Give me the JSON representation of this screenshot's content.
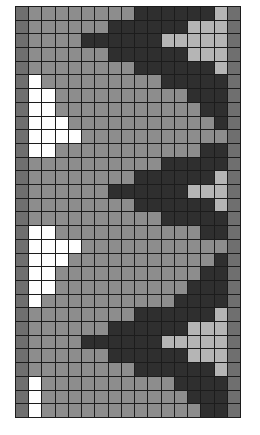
{
  "grid": {
    "rows": 30,
    "columns": 17,
    "palette": {
      "E": "#6f6f6f",
      "M": "#8d8d8d",
      "D": "#2f2f2f",
      "L": "#b5b5b5",
      "W": "#ffffff"
    },
    "palette_names": {
      "E": "edge-gray",
      "M": "mid-gray",
      "D": "dark-gray",
      "L": "light-gray",
      "W": "white"
    },
    "cells": [
      "EMMMMMMMMDDDDDDLE",
      "EMMMMMMDDDDDDLLLE",
      "EMMMMDDDDDDLLLLLE",
      "EMMMMMMDDDDDDLLLE",
      "EMMMMMMMMDDDDDDLE",
      "EWMMMMMMMMMDDDDDE",
      "EWWMMMMMMMMMMDDDE",
      "EWWMMMMMMMMMMMDDE",
      "EWWWMMMMMMMMMMMDE",
      "EWWWWMMMMMMMMMMME",
      "EWWMMMMMMMMMMMDDE",
      "EMMMMMMMMMMDDDDDE",
      "EMMMMMMMMDDDDDDLE",
      "EMMMMMMDDDDDDLLLE",
      "EMMMMMMMMDDDDDDLE",
      "EMMMMMMMMMMDDDDDE",
      "EWWMMMMMMMMMMMDDE",
      "EWWWWMMMMMMMMMMME",
      "EWWWMMMMMMMMMMMDE",
      "EWWMMMMMMMMMMMDDE",
      "EWWMMMMMMMMMMDDDE",
      "EWMMMMMMMMMMDDDDE",
      "EMMMMMMMMDDDDDDLE",
      "EMMMMMMDDDDDDLLLE",
      "EMMMMDDDDDDLLLLLE",
      "EMMMMMMDDDDDDLLLE",
      "EMMMMMMMMDDDDDDLE",
      "EWMMMMMMMMMMDDDDE",
      "EWMMMMMMMMMMMDDDE",
      "EWMMMMMMMMMMMMDDE"
    ]
  }
}
